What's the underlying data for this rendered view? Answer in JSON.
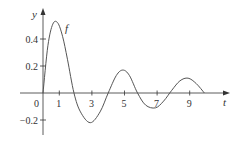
{
  "chart_data": {
    "type": "line",
    "title": "",
    "xlabel": "t",
    "ylabel": "y",
    "curve_label": "f",
    "xlim": [
      -0.7,
      11
    ],
    "ylim": [
      -0.3,
      0.6
    ],
    "x_ticks": [
      1,
      3,
      5,
      7,
      9
    ],
    "x_tick_labels": [
      "1",
      "3",
      "5",
      "7",
      "9"
    ],
    "y_ticks": [
      -0.2,
      0.2,
      0.4
    ],
    "y_tick_labels": [
      "−0.2",
      "0.2",
      "0.4"
    ],
    "origin_label": "0",
    "grid": false,
    "legend": "none",
    "series": [
      {
        "name": "f",
        "x": [
          0,
          0.3,
          0.6,
          0.9,
          1.2,
          1.5,
          1.9,
          2.3,
          2.9,
          3.5,
          4.0,
          4.5,
          4.9,
          5.3,
          5.8,
          6.3,
          6.9,
          7.4,
          7.9,
          8.4,
          8.9,
          9.4,
          9.9
        ],
        "values": [
          0,
          0.35,
          0.51,
          0.52,
          0.42,
          0.25,
          0.0,
          -0.14,
          -0.22,
          -0.14,
          0.0,
          0.13,
          0.17,
          0.13,
          0.0,
          -0.09,
          -0.11,
          -0.06,
          0.02,
          0.09,
          0.11,
          0.07,
          0.0
        ]
      }
    ],
    "colors": {
      "curve": "#555555",
      "axes": "#333333"
    }
  }
}
